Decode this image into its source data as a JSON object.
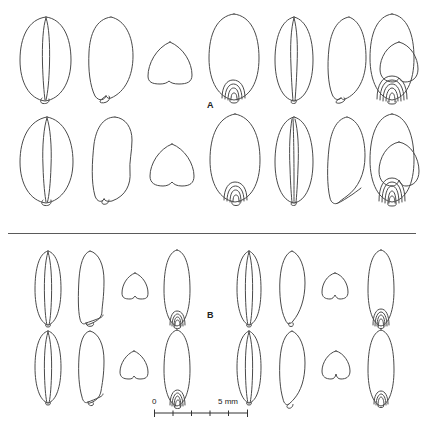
{
  "figure": {
    "type": "scientific-line-drawing-plate",
    "background_color": "#ffffff",
    "line_color": "#4a4a4a",
    "text_color": "#222222"
  },
  "panels": [
    {
      "id": "A",
      "label": "A",
      "rows": [
        {
          "row_index": 1,
          "specimens": [
            {
              "view": "ventral",
              "shape": "broad-oval",
              "has_groove": true,
              "has_embryo_rings": false,
              "embryo_rings": 0
            },
            {
              "view": "lateral",
              "shape": "broad-oval-asymmetric",
              "has_groove": false,
              "has_embryo_rings": false,
              "embryo_rings": 0
            },
            {
              "view": "transverse-section",
              "shape": "rounded-triangular",
              "has_groove": false,
              "has_embryo_rings": false,
              "embryo_rings": 0
            },
            {
              "view": "dorsal-embryo",
              "shape": "broad-oval",
              "has_groove": false,
              "has_embryo_rings": true,
              "embryo_rings": 4
            },
            {
              "view": "ventral",
              "shape": "oval",
              "has_groove": true,
              "has_embryo_rings": false,
              "embryo_rings": 0
            },
            {
              "view": "lateral",
              "shape": "oval-tapered",
              "has_groove": false,
              "has_embryo_rings": false,
              "embryo_rings": 0
            },
            {
              "view": "transverse-section",
              "shape": "rounded-triangular-notched",
              "has_groove": false,
              "has_embryo_rings": false,
              "embryo_rings": 0
            },
            {
              "view": "dorsal-embryo",
              "shape": "oval",
              "has_groove": false,
              "has_embryo_rings": true,
              "embryo_rings": 5
            }
          ]
        },
        {
          "row_index": 2,
          "specimens": [
            {
              "view": "ventral",
              "shape": "broad-oval",
              "has_groove": true,
              "has_embryo_rings": false,
              "embryo_rings": 0
            },
            {
              "view": "lateral",
              "shape": "broad-oval-asymmetric",
              "has_groove": false,
              "has_embryo_rings": false,
              "embryo_rings": 0
            },
            {
              "view": "transverse-section",
              "shape": "rounded-triangular",
              "has_groove": false,
              "has_embryo_rings": false,
              "embryo_rings": 0
            },
            {
              "view": "dorsal-embryo",
              "shape": "broad-oval",
              "has_groove": false,
              "has_embryo_rings": true,
              "embryo_rings": 4
            },
            {
              "view": "ventral",
              "shape": "oval",
              "has_groove": true,
              "has_embryo_rings": false,
              "embryo_rings": 0
            },
            {
              "view": "lateral",
              "shape": "oval-tapered",
              "has_groove": false,
              "has_embryo_rings": false,
              "embryo_rings": 0
            },
            {
              "view": "transverse-section",
              "shape": "rounded-triangular-notched",
              "has_groove": false,
              "has_embryo_rings": false,
              "embryo_rings": 0
            },
            {
              "view": "dorsal-embryo",
              "shape": "oval",
              "has_groove": false,
              "has_embryo_rings": true,
              "embryo_rings": 5
            }
          ]
        }
      ]
    },
    {
      "id": "B",
      "label": "B",
      "rows": [
        {
          "row_index": 1,
          "specimens": [
            {
              "view": "ventral",
              "shape": "narrow-elongate",
              "has_groove": true,
              "has_embryo_rings": false,
              "embryo_rings": 0
            },
            {
              "view": "lateral",
              "shape": "narrow-elongate-asymmetric",
              "has_groove": false,
              "has_embryo_rings": false,
              "embryo_rings": 0
            },
            {
              "view": "transverse-section",
              "shape": "rounded-triangular-small",
              "has_groove": false,
              "has_embryo_rings": false,
              "embryo_rings": 0
            },
            {
              "view": "dorsal-embryo",
              "shape": "narrow-elongate",
              "has_groove": false,
              "has_embryo_rings": true,
              "embryo_rings": 4
            },
            {
              "view": "ventral",
              "shape": "narrow-elongate",
              "has_groove": true,
              "has_embryo_rings": false,
              "embryo_rings": 0
            },
            {
              "view": "lateral",
              "shape": "narrow-lanceolate",
              "has_groove": false,
              "has_embryo_rings": false,
              "embryo_rings": 0
            },
            {
              "view": "transverse-section",
              "shape": "rounded-triangular-small",
              "has_groove": false,
              "has_embryo_rings": false,
              "embryo_rings": 0
            },
            {
              "view": "dorsal-embryo",
              "shape": "narrow-elongate",
              "has_groove": false,
              "has_embryo_rings": true,
              "embryo_rings": 4
            }
          ]
        },
        {
          "row_index": 2,
          "specimens": [
            {
              "view": "ventral",
              "shape": "narrow-elongate",
              "has_groove": true,
              "has_embryo_rings": false,
              "embryo_rings": 0
            },
            {
              "view": "lateral",
              "shape": "narrow-elongate-asymmetric",
              "has_groove": false,
              "has_embryo_rings": false,
              "embryo_rings": 0
            },
            {
              "view": "transverse-section",
              "shape": "rounded-triangular-small",
              "has_groove": false,
              "has_embryo_rings": false,
              "embryo_rings": 0
            },
            {
              "view": "dorsal-embryo",
              "shape": "narrow-elongate",
              "has_groove": false,
              "has_embryo_rings": true,
              "embryo_rings": 4
            },
            {
              "view": "ventral",
              "shape": "narrow-elongate",
              "has_groove": true,
              "has_embryo_rings": false,
              "embryo_rings": 0
            },
            {
              "view": "lateral",
              "shape": "narrow-lanceolate",
              "has_groove": false,
              "has_embryo_rings": false,
              "embryo_rings": 0
            },
            {
              "view": "transverse-section",
              "shape": "rounded-triangular-notched-small",
              "has_groove": false,
              "has_embryo_rings": false,
              "embryo_rings": 0
            },
            {
              "view": "dorsal-embryo",
              "shape": "narrow-elongate",
              "has_groove": false,
              "has_embryo_rings": true,
              "embryo_rings": 3
            }
          ]
        }
      ]
    }
  ],
  "scalebar": {
    "min_label": "0",
    "max_label": "5 mm",
    "unit": "mm",
    "min_value": 0,
    "max_value": 5,
    "tick_count": 6,
    "minor_tick_interval": 1
  }
}
